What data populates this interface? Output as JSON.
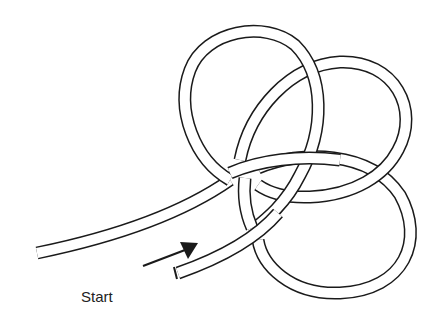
{
  "diagram": {
    "type": "knot-tying-illustration",
    "label_start": "Start",
    "colors": {
      "outline": "#1a1a1a",
      "rope_fill": "#ffffff",
      "background": "#ffffff"
    }
  }
}
